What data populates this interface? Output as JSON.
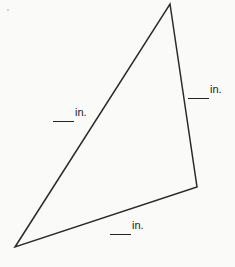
{
  "diagram": {
    "type": "triangle",
    "vertices": [
      [
        170,
        4
      ],
      [
        197,
        187
      ],
      [
        15,
        247
      ]
    ],
    "stroke_color": "#2a2a2a",
    "labels": {
      "left_side": {
        "blank": "",
        "unit": "in."
      },
      "right_side": {
        "blank": "",
        "unit": "in."
      },
      "bottom_side": {
        "blank": "",
        "unit": "in."
      }
    }
  }
}
